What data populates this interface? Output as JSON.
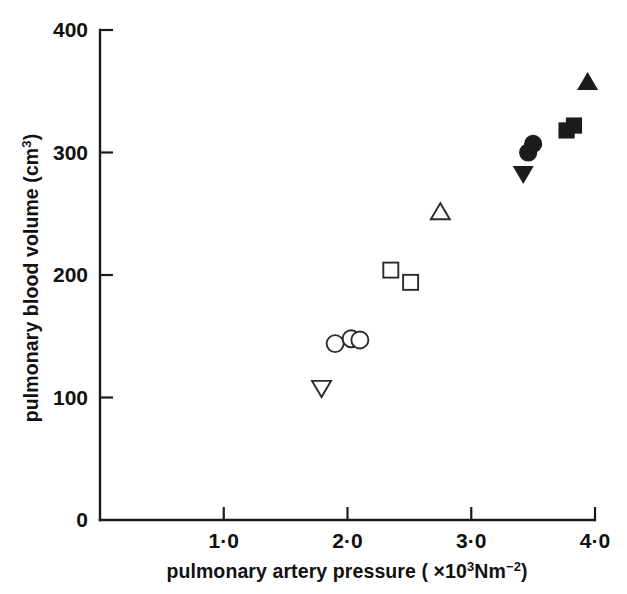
{
  "chart_data": {
    "type": "scatter",
    "title": "",
    "xlabel": "pulmonary artery pressure (×10³Nm⁻²)",
    "ylabel": "pulmonary blood volume (cm³)",
    "xlim": [
      0,
      4.0
    ],
    "ylim": [
      0,
      400
    ],
    "grid": false,
    "legend": "none",
    "x_ticks": [
      {
        "value": 1.0,
        "label": "1·0"
      },
      {
        "value": 2.0,
        "label": "2·0"
      },
      {
        "value": 3.0,
        "label": "3·0"
      },
      {
        "value": 4.0,
        "label": "4·0"
      }
    ],
    "y_ticks": [
      {
        "value": 0,
        "label": "0"
      },
      {
        "value": 100,
        "label": "100"
      },
      {
        "value": 200,
        "label": "200"
      },
      {
        "value": 300,
        "label": "300"
      },
      {
        "value": 400,
        "label": "400"
      }
    ],
    "points": [
      {
        "x": 1.79,
        "y": 108,
        "marker": "triangle-down",
        "fill": "open"
      },
      {
        "x": 1.9,
        "y": 144,
        "marker": "circle",
        "fill": "open"
      },
      {
        "x": 2.03,
        "y": 148,
        "marker": "circle",
        "fill": "open"
      },
      {
        "x": 2.1,
        "y": 147,
        "marker": "circle",
        "fill": "open"
      },
      {
        "x": 2.35,
        "y": 204,
        "marker": "square",
        "fill": "open"
      },
      {
        "x": 2.51,
        "y": 194,
        "marker": "square",
        "fill": "open"
      },
      {
        "x": 2.75,
        "y": 251,
        "marker": "triangle-up",
        "fill": "open"
      },
      {
        "x": 3.42,
        "y": 283,
        "marker": "triangle-down",
        "fill": "filled"
      },
      {
        "x": 3.46,
        "y": 300,
        "marker": "circle",
        "fill": "filled"
      },
      {
        "x": 3.5,
        "y": 307,
        "marker": "circle",
        "fill": "filled"
      },
      {
        "x": 3.77,
        "y": 318,
        "marker": "square",
        "fill": "filled"
      },
      {
        "x": 3.83,
        "y": 322,
        "marker": "square",
        "fill": "filled"
      },
      {
        "x": 3.94,
        "y": 357,
        "marker": "triangle-up",
        "fill": "filled"
      }
    ],
    "colors": {
      "axis": "#1a1a1a",
      "marker_open_stroke": "#2b2b2b",
      "marker_filled": "#1c1c1c",
      "background": "#ffffff"
    }
  },
  "xlabel_parts": {
    "main": "pulmonary artery pressure ( ×10",
    "sup1": "3",
    "mid": "Nm",
    "sup2": "−2",
    "tail": ")"
  },
  "ylabel_parts": {
    "main": "pulmonary blood volume (cm",
    "sup": "3",
    "tail": ")"
  }
}
